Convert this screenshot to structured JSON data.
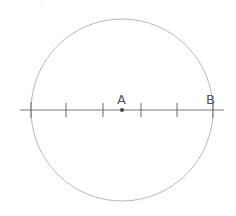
{
  "diagram": {
    "circle": {
      "cx": 122,
      "cy": 110,
      "r": 91,
      "stroke": "#b0b0b0"
    },
    "axis": {
      "x1": 20,
      "x2": 224,
      "y": 110,
      "stroke": "#707070"
    },
    "ticks": [
      31,
      66,
      103,
      141,
      177,
      213
    ],
    "points": {
      "A": {
        "label": "A",
        "x": 122,
        "y": 110
      },
      "B": {
        "label": "B",
        "x": 213,
        "y": 110
      }
    }
  }
}
